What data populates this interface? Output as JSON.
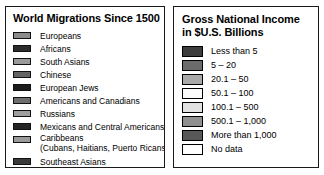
{
  "migrations_legend": {
    "title": "World Migrations Since 1500",
    "items": [
      {
        "label": "Europeans",
        "color": "#8c8c8c"
      },
      {
        "label": "Africans",
        "color": "#2b2b2b"
      },
      {
        "label": "South Asians",
        "color": "#9a9a9a"
      },
      {
        "label": "Chinese",
        "color": "#636363"
      },
      {
        "label": "European Jews",
        "color": "#1c1c1c"
      },
      {
        "label": "Americans and Canadians",
        "color": "#6e6e6e"
      },
      {
        "label": "Russians",
        "color": "#9e9e9e"
      },
      {
        "label": "Mexicans and Central Americans",
        "color": "#242424"
      },
      {
        "label": "Caribbeans",
        "label_line2": "(Cubans, Haitians, Puerto Ricans)",
        "color": "#9a9a9a"
      },
      {
        "label": "Southeast Asians",
        "color": "#3a3a3a"
      }
    ]
  },
  "gni_legend": {
    "title_line1": "Gross National Income",
    "title_line2": "in $U.S. Billions",
    "items": [
      {
        "label": "Less than 5",
        "color": "#3d3d3d"
      },
      {
        "label": "5 – 20",
        "color": "#6b6b6b"
      },
      {
        "label": "20.1 – 50",
        "color": "#a8a8a8"
      },
      {
        "label": "50.1 – 100",
        "color": "#fbfbfb"
      },
      {
        "label": "100.1 – 500",
        "color": "#e2e2e2"
      },
      {
        "label": "500.1 – 1,000",
        "color": "#8f8f8f"
      },
      {
        "label": "More than 1,000",
        "color": "#585858"
      },
      {
        "label": "No data",
        "color": "#ffffff"
      }
    ]
  }
}
